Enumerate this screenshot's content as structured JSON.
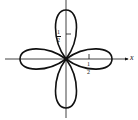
{
  "diagram": {
    "type": "polar rose curve",
    "petals": 4,
    "axis_labels": {
      "x": "x"
    },
    "tick_labels": {
      "vertical": {
        "numerator": "1",
        "denominator": "2"
      },
      "horizontal": {
        "numerator": "1",
        "denominator": "2"
      }
    },
    "colors": {
      "stroke": "#111111",
      "background": "#ffffff"
    }
  }
}
